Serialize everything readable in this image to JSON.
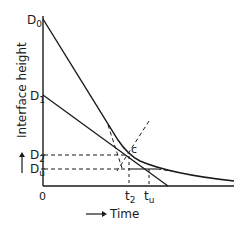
{
  "diagram": {
    "type": "settling-curve",
    "axes": {
      "x_label": "Time",
      "y_label": "Interface height",
      "origin_label": "0",
      "x_arrow": "→",
      "y_arrow": "↑"
    },
    "y_markers": [
      {
        "key": "D0",
        "main": "D",
        "sub": "0"
      },
      {
        "key": "D1",
        "main": "D",
        "sub": "1"
      },
      {
        "key": "D2",
        "main": "D",
        "sub": "2"
      },
      {
        "key": "Du",
        "main": "D",
        "sub": "u"
      }
    ],
    "x_markers": [
      {
        "key": "t2",
        "main": "t",
        "sub": "2"
      },
      {
        "key": "tu",
        "main": "t",
        "sub": "u"
      }
    ],
    "point_label": "c",
    "colors": {
      "line": "#1a1a1a",
      "background": "#ffffff"
    }
  }
}
